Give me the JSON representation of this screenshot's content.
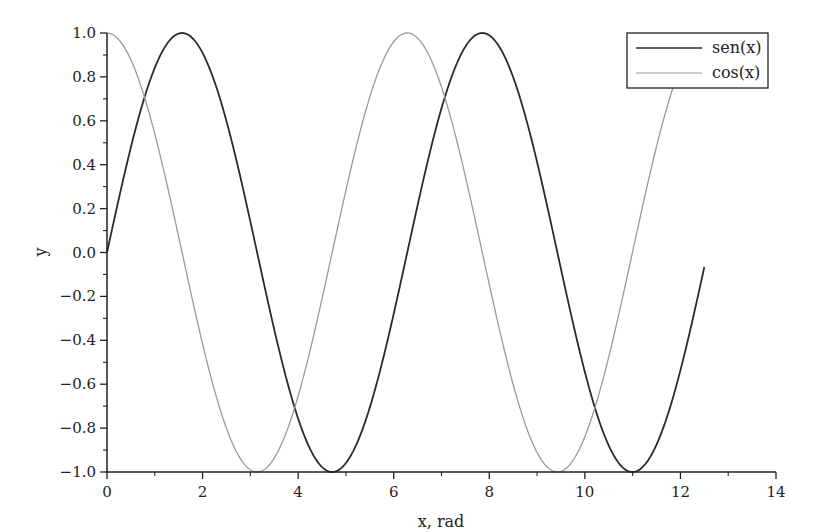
{
  "chart_data": {
    "type": "line",
    "title": "",
    "xlabel": "x, rad",
    "ylabel": "y",
    "xlim": [
      0,
      14
    ],
    "ylim": [
      -1.0,
      1.0
    ],
    "grid": false,
    "legend_position": "upper right",
    "x_ticks": [
      "0",
      "2",
      "4",
      "6",
      "8",
      "10",
      "12",
      "14"
    ],
    "y_ticks": [
      "1.0",
      "0.8",
      "0.6",
      "0.4",
      "0.2",
      "0.0",
      "−0.2",
      "−0.4",
      "−0.6",
      "−0.8",
      "−1.0"
    ],
    "x_range_plotted": [
      0,
      12.5
    ],
    "series": [
      {
        "name": "sen(x)",
        "function": "sin",
        "color": "#2b2b2b",
        "x": [
          0,
          1.0,
          1.571,
          2.0,
          3.0,
          3.142,
          4.0,
          4.712,
          5.0,
          6.0,
          6.283,
          7.0,
          7.854,
          8.0,
          9.0,
          9.425,
          10.0,
          10.996,
          11.0,
          12.0,
          12.5
        ],
        "values": [
          0.0,
          0.841,
          1.0,
          0.909,
          0.141,
          0.0,
          -0.757,
          -1.0,
          -0.959,
          -0.279,
          0.0,
          0.657,
          1.0,
          0.989,
          0.412,
          0.0,
          -0.544,
          -1.0,
          -1.0,
          -0.537,
          -0.066
        ]
      },
      {
        "name": "cos(x)",
        "function": "cos",
        "color": "#9a9a9a",
        "x": [
          0,
          1.0,
          1.571,
          2.0,
          3.0,
          3.142,
          4.0,
          4.712,
          5.0,
          6.0,
          6.283,
          7.0,
          7.854,
          8.0,
          9.0,
          9.425,
          10.0,
          10.996,
          11.0,
          12.0,
          12.5
        ],
        "values": [
          1.0,
          0.54,
          0.0,
          -0.416,
          -0.99,
          -1.0,
          -0.654,
          0.0,
          0.284,
          0.96,
          1.0,
          0.754,
          0.0,
          -0.146,
          -0.911,
          -1.0,
          -0.839,
          0.0,
          0.004,
          0.844,
          0.998
        ]
      }
    ]
  },
  "legend": {
    "items": [
      {
        "label": "sen(x)",
        "color": "#2b2b2b"
      },
      {
        "label": "cos(x)",
        "color": "#9a9a9a"
      }
    ]
  },
  "axes": {
    "x_label": "x, rad",
    "y_label": "y"
  }
}
